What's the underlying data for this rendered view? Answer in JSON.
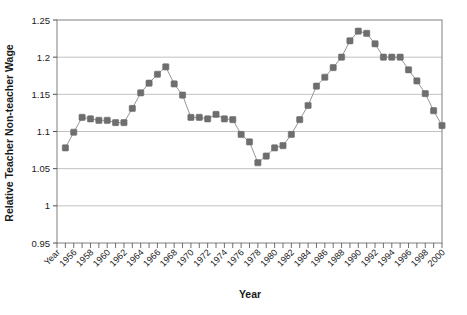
{
  "chart_data": {
    "type": "line",
    "title": "",
    "xlabel": "Year",
    "ylabel": "Relative Teacher Non-teacher Wage",
    "ylim": [
      0.95,
      1.25
    ],
    "ytick_values": [
      0.95,
      1,
      1.05,
      1.1,
      1.15,
      1.2,
      1.25
    ],
    "ytick_labels": [
      "0.95",
      "1",
      "1.05",
      "1.1",
      "1.15",
      "1.2",
      "1.25"
    ],
    "xlim": [
      1954,
      2000
    ],
    "xtick_labels": [
      "Year",
      "1956",
      "1958",
      "1960",
      "1962",
      "1964",
      "1966",
      "1968",
      "1970",
      "1972",
      "1974",
      "1976",
      "1978",
      "1980",
      "1982",
      "1984",
      "1986",
      "1988",
      "1990",
      "1992",
      "1994",
      "1996",
      "1998",
      "2000"
    ],
    "xtick_years": [
      1954,
      1956,
      1958,
      1960,
      1962,
      1964,
      1966,
      1968,
      1970,
      1972,
      1974,
      1976,
      1978,
      1980,
      1982,
      1984,
      1986,
      1988,
      1990,
      1992,
      1994,
      1996,
      1998,
      2000
    ],
    "minor_ticks_every": 1,
    "grid": "horizontal",
    "legend": "none",
    "marker": "square",
    "marker_color": "#6e6e6e",
    "line_color": "#8a8a8a",
    "x": [
      1955,
      1956,
      1957,
      1958,
      1959,
      1960,
      1961,
      1962,
      1963,
      1964,
      1965,
      1966,
      1967,
      1968,
      1969,
      1970,
      1971,
      1972,
      1973,
      1974,
      1975,
      1976,
      1977,
      1978,
      1979,
      1980,
      1981,
      1982,
      1983,
      1984,
      1985,
      1986,
      1987,
      1988,
      1989,
      1990,
      1991,
      1992,
      1993,
      1994,
      1995,
      1996,
      1997,
      1998,
      1999,
      2000
    ],
    "values": [
      1.078,
      1.099,
      1.119,
      1.117,
      1.115,
      1.115,
      1.112,
      1.112,
      1.131,
      1.152,
      1.165,
      1.177,
      1.187,
      1.164,
      1.149,
      1.119,
      1.119,
      1.117,
      1.123,
      1.117,
      1.116,
      1.096,
      1.086,
      1.058,
      1.067,
      1.078,
      1.081,
      1.096,
      1.116,
      1.135,
      1.161,
      1.173,
      1.186,
      1.2,
      1.222,
      1.235,
      1.232,
      1.218,
      1.2,
      1.2,
      1.2,
      1.183,
      1.168,
      1.151,
      1.128,
      1.108
    ]
  }
}
